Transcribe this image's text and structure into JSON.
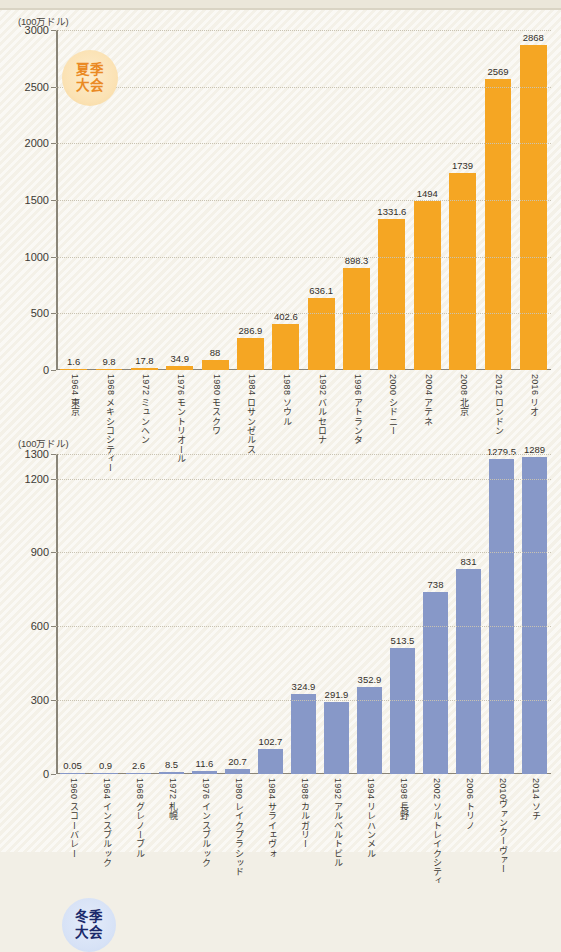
{
  "chart_data": [
    {
      "type": "bar",
      "id": "summer",
      "title": "夏季大会",
      "badge_lines": [
        "夏季",
        "大会"
      ],
      "unit_label": "(100万ドル)",
      "ylabel": "",
      "xlabel": "",
      "ylim": [
        0,
        3000
      ],
      "yticks": [
        0,
        500,
        1000,
        1500,
        2000,
        2500,
        3000
      ],
      "ytick_labels": [
        "0",
        "500",
        "1000",
        "1500",
        "2000",
        "2500",
        "3000"
      ],
      "grid": true,
      "legend": "none",
      "bar_color": "#F5A623",
      "categories": [
        "1964 東京",
        "1968 メキシコシティー",
        "1972 ミュンヘン",
        "1976 モントリオール",
        "1980 モスクワ",
        "1984 ロサンゼルス",
        "1988 ソウル",
        "1992 バルセロナ",
        "1996 アトランタ",
        "2000 シドニー",
        "2004 アテネ",
        "2008 北京",
        "2012 ロンドン",
        "2016 リオ"
      ],
      "values": [
        1.6,
        9.8,
        17.8,
        34.9,
        88,
        286.9,
        402.6,
        636.1,
        898.3,
        1331.6,
        1494,
        1739,
        2569,
        2868
      ],
      "value_labels": [
        "1.6",
        "9.8",
        "17.8",
        "34.9",
        "88",
        "286.9",
        "402.6",
        "636.1",
        "898.3",
        "1331.6",
        "1494",
        "1739",
        "2569",
        "2868"
      ]
    },
    {
      "type": "bar",
      "id": "winter",
      "title": "冬季大会",
      "badge_lines": [
        "冬季",
        "大会"
      ],
      "unit_label": "(100万ドル)",
      "ylabel": "",
      "xlabel": "",
      "ylim": [
        0,
        1300
      ],
      "yticks": [
        0,
        300,
        600,
        900,
        1200,
        1300
      ],
      "ytick_labels": [
        "0",
        "300",
        "600",
        "900",
        "1200",
        "1300"
      ],
      "grid": true,
      "legend": "none",
      "bar_color": "#8798C8",
      "categories": [
        "1960 スコーバレー",
        "1964 インスブルック",
        "1968 グレノーブル",
        "1972 札幌",
        "1976 インスブルック",
        "1980 レイクプラシッド",
        "1984 サライェヴォ",
        "1988 カルガリー",
        "1992 アルベルトビル",
        "1994 リレハンメル",
        "1998 長野",
        "2002 ソルトレイクシティ",
        "2006 トリノ",
        "2010ヴァンクーヴァー",
        "2014 ソチ"
      ],
      "values": [
        0.05,
        0.9,
        2.6,
        8.5,
        11.6,
        20.7,
        102.7,
        324.9,
        291.9,
        352.9,
        513.5,
        738,
        831,
        1279.5,
        1289
      ],
      "value_labels": [
        "0.05",
        "0.9",
        "2.6",
        "8.5",
        "11.6",
        "20.7",
        "102.7",
        "324.9",
        "291.9",
        "352.9",
        "513.5",
        "738",
        "831",
        "1279.5",
        "1289"
      ]
    }
  ]
}
